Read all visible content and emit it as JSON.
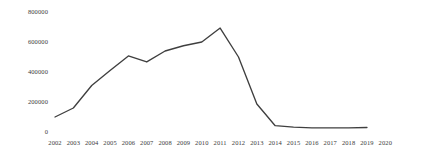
{
  "chart_data": {
    "type": "line",
    "title": "",
    "subtitle": "",
    "xlabel": "",
    "ylabel": "",
    "grid": false,
    "legend": "none",
    "line_color": "#3f3f3f",
    "text_color": "#3a3a3a",
    "background_color": "#ffffff",
    "xlim": [
      2002,
      2020
    ],
    "ylim": [
      0,
      800000
    ],
    "x_tick_labels": [
      "2002",
      "2003",
      "2004",
      "2005",
      "2006",
      "2007",
      "2008",
      "2009",
      "2010",
      "2011",
      "2012",
      "2013",
      "2014",
      "2015",
      "2016",
      "2017",
      "2018",
      "2019",
      "2020"
    ],
    "y_tick_labels": [
      "0",
      "200000",
      "400000",
      "600000",
      "800000"
    ],
    "y_tick_values": [
      0,
      200000,
      400000,
      600000,
      800000
    ],
    "categories": [
      2002,
      2003,
      2004,
      2005,
      2006,
      2007,
      2008,
      2009,
      2010,
      2011,
      2012,
      2013,
      2014,
      2015,
      2016,
      2017,
      2018,
      2019
    ],
    "values": [
      100000,
      160000,
      310000,
      410000,
      507000,
      467000,
      540000,
      575000,
      600000,
      693000,
      500000,
      187000,
      42000,
      32000,
      28000,
      27000,
      28000,
      30000
    ],
    "series": [
      {
        "name": "series-1",
        "x": [
          2002,
          2003,
          2004,
          2005,
          2006,
          2007,
          2008,
          2009,
          2010,
          2011,
          2012,
          2013,
          2014,
          2015,
          2016,
          2017,
          2018,
          2019
        ],
        "values": [
          100000,
          160000,
          310000,
          410000,
          507000,
          467000,
          540000,
          575000,
          600000,
          693000,
          500000,
          187000,
          42000,
          32000,
          28000,
          27000,
          28000,
          30000
        ]
      }
    ],
    "annotations": []
  }
}
